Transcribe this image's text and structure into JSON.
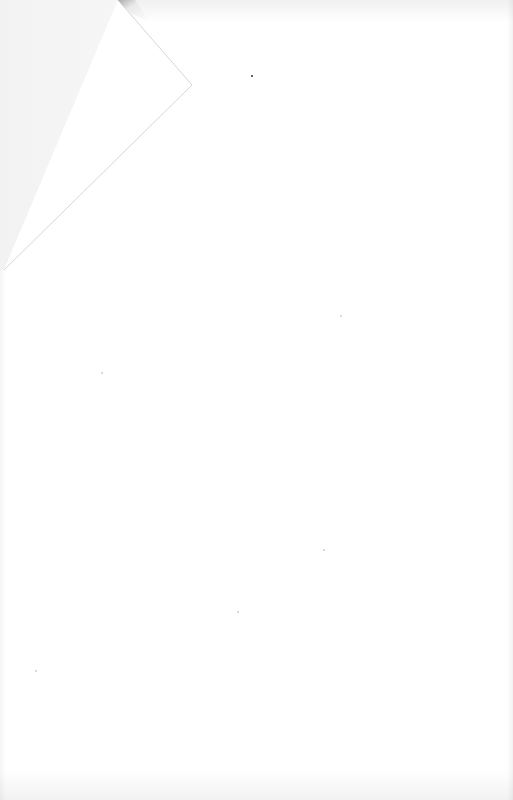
{
  "document": {
    "type": "blank-scanned-page",
    "text": "",
    "colors": {
      "paper": "#ffffff",
      "fold_underside": "#f4f4f4",
      "fold_flap": "#ffffff",
      "fold_edge": "#d8d8d8"
    }
  }
}
